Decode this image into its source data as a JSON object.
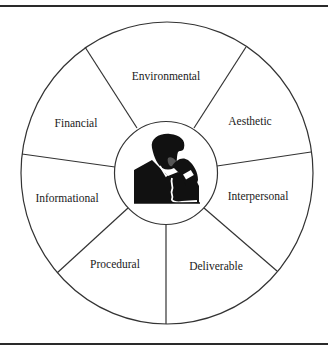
{
  "diagram": {
    "type": "segmented-wheel",
    "center_icon": "person-on-phone-icon",
    "segments": [
      {
        "label": "Environmental",
        "x": 166,
        "y": 77
      },
      {
        "label": "Aesthetic",
        "x": 250,
        "y": 125
      },
      {
        "label": "Interpersonal",
        "x": 258,
        "y": 200
      },
      {
        "label": "Deliverable",
        "x": 215,
        "y": 269
      },
      {
        "label": "Procedural",
        "x": 115,
        "y": 268
      },
      {
        "label": "Informational",
        "x": 68,
        "y": 202
      },
      {
        "label": "Financial",
        "x": 76,
        "y": 127
      }
    ],
    "colors": {
      "stroke": "#333333",
      "background": "#ffffff",
      "icon": "#111111"
    }
  }
}
